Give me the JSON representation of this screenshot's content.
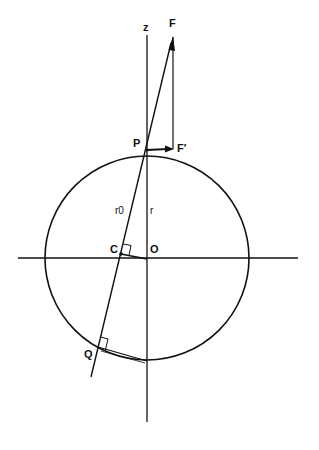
{
  "diagram": {
    "labels": {
      "z": "z",
      "F": "F",
      "F_prime": "F′",
      "P": "P",
      "r0": "r0",
      "r": "r",
      "C": "C",
      "O": "O",
      "Q": "Q"
    },
    "colors": {
      "stroke": "#111111",
      "background": "#ffffff"
    },
    "geometry": {
      "circle_center": [
        147,
        258
      ],
      "circle_radius": 102,
      "z_axis": {
        "x": 147,
        "y1": 35,
        "y2": 422
      },
      "x_axis": {
        "y": 258,
        "x1": 18,
        "x2": 298
      },
      "point_F": [
        173,
        37
      ],
      "point_F_prime": [
        173,
        149
      ],
      "point_P": [
        147,
        150
      ],
      "point_C": [
        121,
        254
      ],
      "point_O": [
        147,
        258
      ],
      "point_Q": [
        98,
        347
      ],
      "point_bottom": [
        147,
        361
      ],
      "line_end": [
        91,
        377
      ]
    }
  }
}
